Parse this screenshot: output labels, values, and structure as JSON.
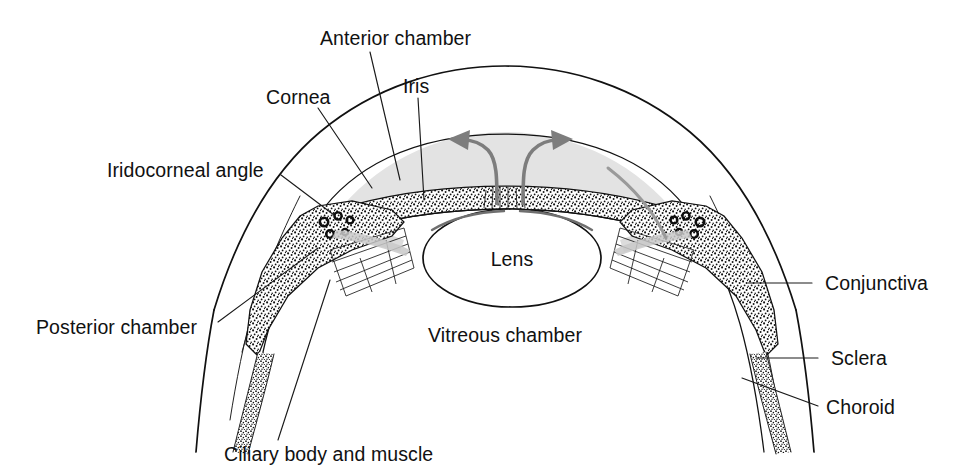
{
  "figure": {
    "background_color": "#ffffff",
    "ink_color": "#111111",
    "arrow_color": "#7d7d7d",
    "chamber_fill": "#e3e3e3",
    "width": 957,
    "height": 474
  },
  "labels": {
    "anterior_chamber": "Anterior chamber",
    "cornea": "Cornea",
    "iris": "Iris",
    "iridocorneal_angle": "Iridocorneal angle",
    "posterior_chamber": "Posterior chamber",
    "ciliary_body": "Ciliary body and muscle",
    "vitreous_chamber": "Vitreous chamber",
    "lens": "Lens",
    "conjunctiva": "Conjunctiva",
    "sclera": "Sclera",
    "choroid": "Choroid"
  },
  "structures": [
    {
      "name": "cornea",
      "label": "Cornea",
      "side": "top-left",
      "has_leader": true
    },
    {
      "name": "anterior-chamber",
      "label": "Anterior chamber",
      "side": "top-center",
      "has_leader": true
    },
    {
      "name": "iris",
      "label": "Iris",
      "side": "top-center",
      "has_leader": true
    },
    {
      "name": "iridocorneal-angle",
      "label": "Iridocorneal angle",
      "side": "left",
      "has_leader": true
    },
    {
      "name": "posterior-chamber",
      "label": "Posterior chamber",
      "side": "left",
      "has_leader": true
    },
    {
      "name": "ciliary-body-and-muscle",
      "label": "Ciliary body and muscle",
      "side": "bottom",
      "has_leader": true
    },
    {
      "name": "vitreous-chamber",
      "label": "Vitreous chamber",
      "side": "center",
      "has_leader": false
    },
    {
      "name": "lens",
      "label": "Lens",
      "side": "center",
      "has_leader": false
    },
    {
      "name": "conjunctiva",
      "label": "Conjunctiva",
      "side": "right",
      "has_leader": true
    },
    {
      "name": "sclera",
      "label": "Sclera",
      "side": "right",
      "has_leader": true
    },
    {
      "name": "choroid",
      "label": "Choroid",
      "side": "right",
      "has_leader": true
    }
  ],
  "flow_arrows": {
    "count": 2,
    "meaning": "aqueous humour flow",
    "color": "#7d7d7d",
    "left_direction": "up-and-left",
    "right_direction": "up-and-right"
  }
}
